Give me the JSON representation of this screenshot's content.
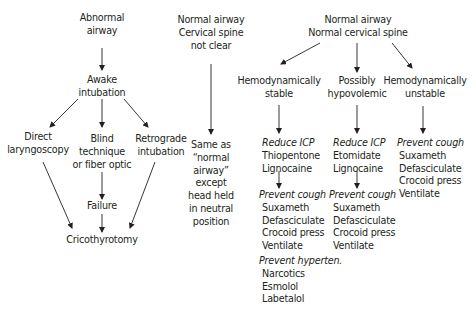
{
  "left_branch": {
    "title": [
      "Abnormal",
      "airway"
    ],
    "awake": [
      "Awake",
      "intubation"
    ],
    "direct": [
      "Direct",
      "laryngoscopy"
    ],
    "blind": [
      "Blind",
      "technique",
      "or fiber optic"
    ],
    "retro": [
      "Retrograde",
      "intubation"
    ],
    "failure": "Failure",
    "crico": "Cricothyrotomy"
  },
  "middle_branch": {
    "title": [
      "Normal airway",
      "Cervical spine",
      "not clear"
    ],
    "note": [
      "Same as",
      "“normal",
      "airway”",
      "except",
      "head held",
      "in neutral",
      "position"
    ]
  },
  "right_branch": {
    "title": [
      "Normal airway",
      "Normal cervical spine"
    ],
    "stable": {
      "label": [
        "Hemodynamically",
        "stable"
      ],
      "reduce_icp": {
        "heading": "Reduce ICP",
        "items": [
          "Thiopentone",
          "Lignocaine"
        ]
      },
      "prevent_cough": {
        "heading": "Prevent cough",
        "items": [
          "Suxameth",
          "Defasciculate",
          "Crocoid press",
          "Ventilate"
        ]
      },
      "prevent_hyperten": {
        "heading": "Prevent hyperten.",
        "items": [
          "Narcotics",
          "Esmolol",
          "Labetalol"
        ]
      }
    },
    "hypovolemic": {
      "label": [
        "Possibly",
        "hypovolemic"
      ],
      "reduce_icp": {
        "heading": "Reduce ICP",
        "items": [
          "Etomidate",
          "Lignocaine"
        ]
      },
      "prevent_cough": {
        "heading": "Prevent cough",
        "items": [
          "Suxameth",
          "Defasciculate",
          "Crocoid press",
          "Ventilate"
        ]
      }
    },
    "unstable": {
      "label": [
        "Hemodynamically",
        "unstable"
      ],
      "prevent_cough": {
        "heading": "Prevent cough",
        "items": [
          "Suxameth",
          "Defasciculate",
          "Crocoid press",
          "Ventilate"
        ]
      }
    }
  }
}
